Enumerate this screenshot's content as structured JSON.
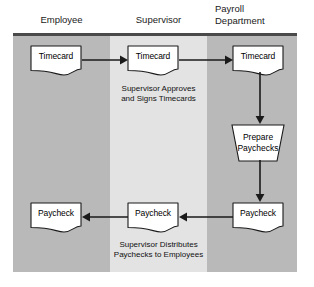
{
  "diagram": {
    "lanes": [
      {
        "id": "employee",
        "label": "Employee",
        "fill": "#b9b9b9"
      },
      {
        "id": "supervisor",
        "label": "Supervisor",
        "fill": "#e3e3e3"
      },
      {
        "id": "payroll",
        "label": "Payroll\nDepartment",
        "fill": "#b9b9b9"
      }
    ],
    "nodes": [
      {
        "id": "timecard-employee",
        "label": "Timecard",
        "shape": "document",
        "lane": "employee"
      },
      {
        "id": "timecard-supervisor",
        "label": "Timecard",
        "shape": "document",
        "lane": "supervisor"
      },
      {
        "id": "timecard-payroll",
        "label": "Timecard",
        "shape": "document",
        "lane": "payroll"
      },
      {
        "id": "prepare-paychecks",
        "label": "Prepare\nPaychecks",
        "shape": "manual-operation",
        "lane": "payroll"
      },
      {
        "id": "paycheck-payroll",
        "label": "Paycheck",
        "shape": "document",
        "lane": "payroll"
      },
      {
        "id": "paycheck-supervisor",
        "label": "Paycheck",
        "shape": "document",
        "lane": "supervisor"
      },
      {
        "id": "paycheck-employee",
        "label": "Paycheck",
        "shape": "document",
        "lane": "employee"
      }
    ],
    "captions": [
      {
        "id": "supervisor-approves",
        "text": "Supervisor Approves\nand Signs Timecards"
      },
      {
        "id": "supervisor-distributes",
        "text": "Supervisor Distributes\nPaychecks to Employees"
      }
    ],
    "arrows": [
      {
        "id": "timecard-employee-to-supervisor",
        "direction": "right"
      },
      {
        "id": "timecard-supervisor-to-payroll",
        "direction": "right"
      },
      {
        "id": "timecard-payroll-to-prepare",
        "direction": "down"
      },
      {
        "id": "prepare-to-paycheck-payroll",
        "direction": "down"
      },
      {
        "id": "paycheck-payroll-to-supervisor",
        "direction": "left"
      },
      {
        "id": "paycheck-supervisor-to-employee",
        "direction": "left"
      }
    ],
    "colors": {
      "lane_dark": "#b9b9b9",
      "lane_light": "#e3e3e3",
      "shape_fill": "#ffffff",
      "stroke": "#1a1a1a",
      "rule": "#4a4a4a",
      "background": "#ffffff"
    }
  }
}
